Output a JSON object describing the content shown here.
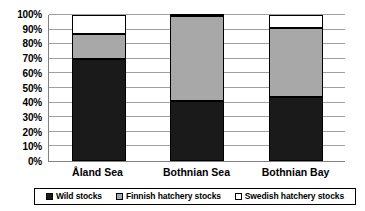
{
  "chart_data": {
    "type": "bar",
    "subtype": "100% stacked bar",
    "title": "",
    "subtitle": "",
    "xlabel": "",
    "ylabel": "",
    "categories": [
      "Åland Sea",
      "Bothnian Sea",
      "Bothnian Bay"
    ],
    "series": [
      {
        "name": "Wild stocks",
        "values": [
          70,
          41,
          44
        ],
        "color": "#1a1a1a"
      },
      {
        "name": "Finnish hatchery stocks",
        "values": [
          17,
          58,
          47
        ],
        "color": "#a8a8a8"
      },
      {
        "name": "Swedish hatchery stocks",
        "values": [
          13,
          1,
          9
        ],
        "color": "#ffffff"
      }
    ],
    "ylim": [
      0,
      100
    ],
    "ytick_values": [
      0,
      10,
      20,
      30,
      40,
      50,
      60,
      70,
      80,
      90,
      100
    ],
    "ytick_labels": [
      "0%",
      "10%",
      "20%",
      "30%",
      "40%",
      "50%",
      "60%",
      "70%",
      "80%",
      "90%",
      "100%"
    ],
    "grid": true,
    "grid_axis": "y",
    "legend_position": "bottom",
    "legend_entries": [
      {
        "label": "Wild stocks",
        "swatch": "#1a1a1a"
      },
      {
        "label": "Finnish hatchery stocks",
        "swatch": "#a8a8a8"
      },
      {
        "label": "Swedish hatchery stocks",
        "swatch": "#ffffff"
      }
    ],
    "cumulative_tops": [
      [
        70,
        87,
        100
      ],
      [
        41,
        99,
        100
      ],
      [
        44,
        91,
        100
      ]
    ]
  },
  "colors": {
    "background": "#ffffff",
    "axis": "#808080",
    "gridline": "#a0a0a0",
    "border": "#000000",
    "text": "#000000"
  }
}
